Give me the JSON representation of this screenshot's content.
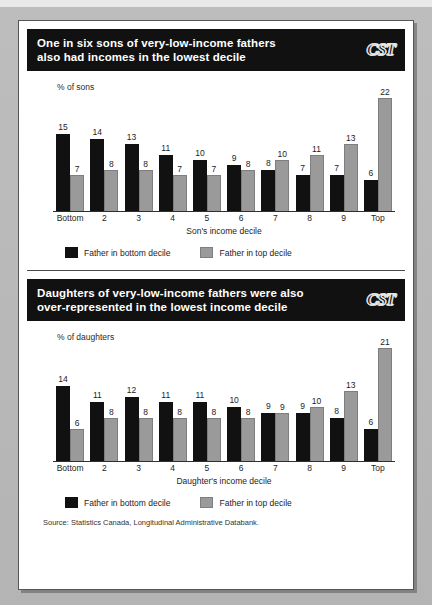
{
  "document": {
    "source_note": "Source: Statistics Canada, Longitudinal Administrative Databank."
  },
  "panels": [
    {
      "id": "sons",
      "logo": "CST",
      "logo_icon": "cst-logo-icon",
      "title": "One in six sons of very-low-income fathers\nalso had incomes in the lowest decile",
      "ylabel": "% of sons",
      "xlabel": "Son's income decile",
      "legend": [
        {
          "label": "Father in bottom decile",
          "color": "#111111"
        },
        {
          "label": "Father in top decile",
          "color": "#9a9a9a"
        }
      ],
      "chart_data": {
        "type": "bar",
        "title": "One in six sons of very-low-income fathers also had incomes in the lowest decile",
        "xlabel": "Son's income decile",
        "ylabel": "% of sons",
        "ylim": [
          0,
          23
        ],
        "grid": false,
        "legend_position": "bottom-left",
        "categories": [
          "Bottom",
          "2",
          "3",
          "4",
          "5",
          "6",
          "7",
          "8",
          "9",
          "Top"
        ],
        "series": [
          {
            "name": "Father in bottom decile",
            "color": "#111111",
            "values": [
              15,
              14,
              13,
              11,
              10,
              9,
              8,
              7,
              7,
              6
            ]
          },
          {
            "name": "Father in top decile",
            "color": "#9a9a9a",
            "values": [
              7,
              8,
              8,
              7,
              7,
              8,
              10,
              11,
              13,
              22
            ]
          }
        ]
      }
    },
    {
      "id": "daughters",
      "logo": "CST",
      "logo_icon": "cst-logo-icon",
      "title": "Daughters of very-low-income fathers were also\nover-represented in the lowest income decile",
      "ylabel": "% of daughters",
      "xlabel": "Daughter's income decile",
      "legend": [
        {
          "label": "Father in bottom decile",
          "color": "#111111"
        },
        {
          "label": "Father in top decile",
          "color": "#9a9a9a"
        }
      ],
      "chart_data": {
        "type": "bar",
        "title": "Daughters of very-low-income fathers were also over-represented in the lowest income decile",
        "xlabel": "Daughter's income decile",
        "ylabel": "% of daughters",
        "ylim": [
          0,
          22
        ],
        "grid": false,
        "legend_position": "bottom-left",
        "categories": [
          "Bottom",
          "2",
          "3",
          "4",
          "5",
          "6",
          "7",
          "8",
          "9",
          "Top"
        ],
        "series": [
          {
            "name": "Father in bottom decile",
            "color": "#111111",
            "values": [
              14,
              11,
              12,
              11,
              11,
              10,
              9,
              9,
              8,
              6
            ]
          },
          {
            "name": "Father in top decile",
            "color": "#9a9a9a",
            "values": [
              6,
              8,
              8,
              8,
              8,
              8,
              9,
              10,
              13,
              21
            ]
          }
        ]
      }
    }
  ]
}
